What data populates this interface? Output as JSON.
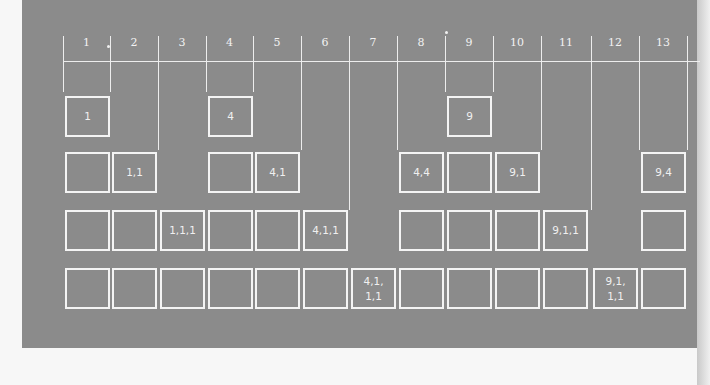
{
  "diagram": {
    "title": "",
    "columns": [
      "1",
      "2",
      "3",
      "4",
      "5",
      "6",
      "7",
      "8",
      "9",
      "10",
      "11",
      "12",
      "13"
    ],
    "rows": [
      {
        "name": "row-1",
        "cells": [
          {
            "col": 1,
            "label": "1"
          },
          {
            "col": 4,
            "label": "4"
          },
          {
            "col": 9,
            "label": "9"
          }
        ]
      },
      {
        "name": "row-2",
        "cells": [
          {
            "col": 1,
            "label": ""
          },
          {
            "col": 2,
            "label": "1,1"
          },
          {
            "col": 4,
            "label": ""
          },
          {
            "col": 5,
            "label": "4,1"
          },
          {
            "col": 8,
            "label": "4,4"
          },
          {
            "col": 9,
            "label": ""
          },
          {
            "col": 10,
            "label": "9,1"
          },
          {
            "col": 13,
            "label": "9,4"
          }
        ]
      },
      {
        "name": "row-3",
        "cells": [
          {
            "col": 1,
            "label": ""
          },
          {
            "col": 2,
            "label": ""
          },
          {
            "col": 3,
            "label": "1,1,1"
          },
          {
            "col": 4,
            "label": ""
          },
          {
            "col": 5,
            "label": ""
          },
          {
            "col": 6,
            "label": "4,1,1"
          },
          {
            "col": 8,
            "label": ""
          },
          {
            "col": 9,
            "label": ""
          },
          {
            "col": 10,
            "label": ""
          },
          {
            "col": 11,
            "label": "9,1,1"
          },
          {
            "col": 13,
            "label": ""
          }
        ]
      },
      {
        "name": "row-4",
        "cells": [
          {
            "col": 1,
            "label": ""
          },
          {
            "col": 2,
            "label": ""
          },
          {
            "col": 3,
            "label": ""
          },
          {
            "col": 4,
            "label": ""
          },
          {
            "col": 5,
            "label": ""
          },
          {
            "col": 6,
            "label": ""
          },
          {
            "col": 7,
            "label": "4,1,\n1,1"
          },
          {
            "col": 8,
            "label": ""
          },
          {
            "col": 9,
            "label": ""
          },
          {
            "col": 10,
            "label": ""
          },
          {
            "col": 11,
            "label": ""
          },
          {
            "col": 12,
            "label": "9,1,\n1,1"
          },
          {
            "col": 13,
            "label": ""
          }
        ]
      }
    ],
    "dividers_extend_to_row": [
      1,
      1,
      2,
      1,
      1,
      2,
      3,
      2,
      1,
      1,
      2,
      3,
      2,
      2
    ],
    "colors": {
      "panel_background": "#8b8b8b",
      "line_color": "#ededed",
      "page_background": "#f7f7f7"
    }
  }
}
